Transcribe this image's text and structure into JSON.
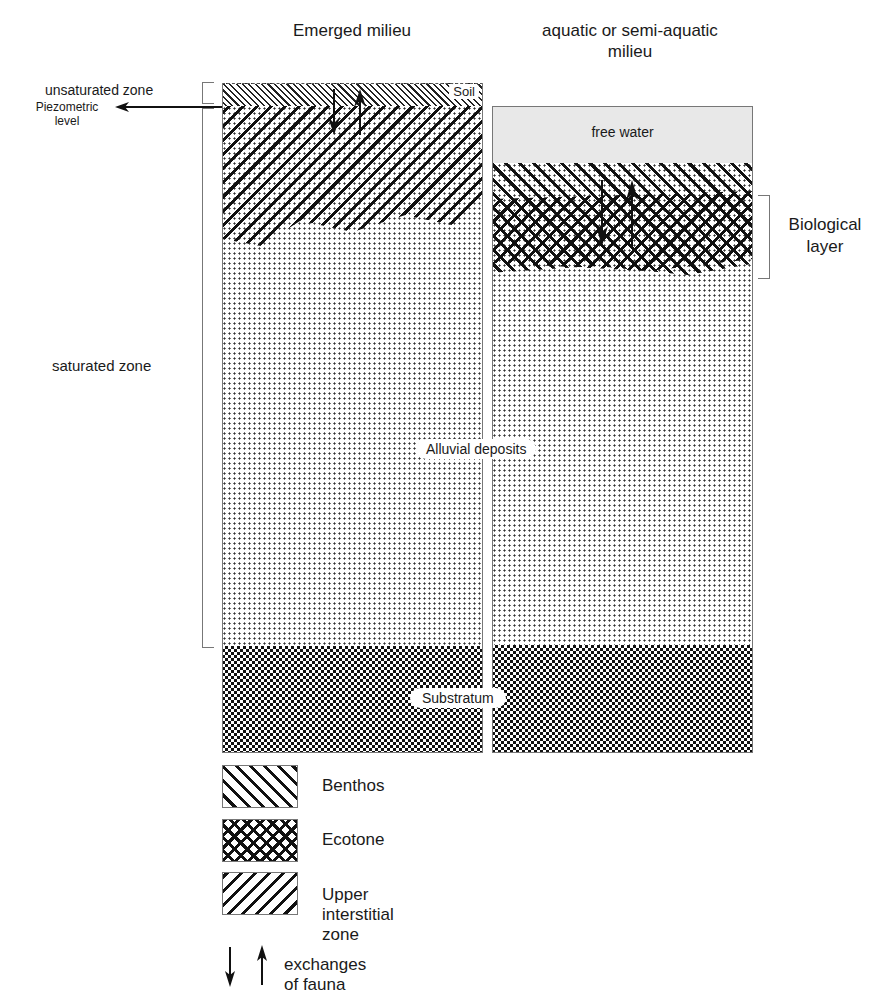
{
  "headers": {
    "left_title": "Emerged milieu",
    "right_title_line1": "aquatic or semi-aquatic",
    "right_title_line2": "milieu"
  },
  "left_labels": {
    "unsaturated_zone": "unsaturated zone",
    "piezometric_line1": "Piezometric",
    "piezometric_line2": "level",
    "saturated_zone": "saturated zone"
  },
  "layers": {
    "soil": "Soil",
    "free_water": "free water",
    "alluvial": "Alluvial deposits",
    "substratum": "Substratum"
  },
  "right_labels": {
    "biological_line1": "Biological",
    "biological_line2": "layer"
  },
  "legend": {
    "items": [
      {
        "pattern": "benthos-hatch",
        "label": "Benthos"
      },
      {
        "pattern": "ecotone-crosshatch",
        "label": "Ecotone"
      },
      {
        "pattern": "upper-interstitial-hatch",
        "label": "Upper interstitial zone"
      }
    ],
    "arrows_label": "exchanges of fauna"
  },
  "colors": {
    "ink": "#1a1a1a",
    "free_water": "#e8e8e8",
    "frame": "#777777"
  }
}
